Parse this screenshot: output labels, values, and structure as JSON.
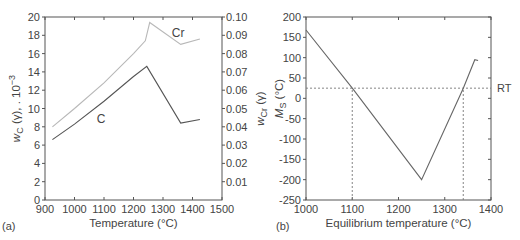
{
  "figure": {
    "width": 520,
    "height": 240,
    "colors": {
      "axis": "#555555",
      "text": "#444444",
      "c_curve": "#555555",
      "cr_curve": "#b8b8b8",
      "ms_curve": "#666666",
      "dashed": "#777777"
    }
  },
  "chart_data": [
    {
      "type": "line",
      "panel_label": "(a)",
      "title": "",
      "xlabel": "Temperature (°C)",
      "ylabel": "w_C (γ), . 10^-3",
      "ylabel_right": "w_Cr (γ)",
      "xlim": [
        900,
        1500
      ],
      "ylim": [
        0,
        20
      ],
      "ylim_right": [
        0,
        0.1
      ],
      "grid": false,
      "legend": "inline curve labels",
      "x_ticks": [
        900,
        1000,
        1100,
        1200,
        1300,
        1400,
        1500
      ],
      "y_ticks": [
        0,
        2,
        4,
        6,
        8,
        10,
        12,
        14,
        16,
        18,
        20
      ],
      "y_ticks_right": [
        "0.01",
        "0.02",
        "0.03",
        "0.04",
        "0.05",
        "0.06",
        "0.07",
        "0.08",
        "0.09",
        "0.10"
      ],
      "series": [
        {
          "name": "C",
          "axis": "left",
          "label_pos": [
            1075,
            8.9
          ],
          "x": [
            925,
            1000,
            1100,
            1200,
            1245,
            1360,
            1425
          ],
          "y": [
            6.6,
            8.3,
            10.8,
            13.5,
            14.6,
            8.4,
            8.8
          ]
        },
        {
          "name": "Cr",
          "axis": "right",
          "label_pos": [
            1330,
            0.091
          ],
          "x": [
            925,
            1000,
            1100,
            1200,
            1240,
            1255,
            1360,
            1425
          ],
          "y": [
            0.04,
            0.05,
            0.064,
            0.08,
            0.087,
            0.097,
            0.085,
            0.088
          ]
        }
      ]
    },
    {
      "type": "line",
      "panel_label": "(b)",
      "title": "",
      "xlabel": "Equilibrium temperature (°C)",
      "ylabel": "M_S (°C)",
      "xlim": [
        1000,
        1400
      ],
      "ylim": [
        -250,
        200
      ],
      "grid": false,
      "x_ticks": [
        1000,
        1100,
        1200,
        1300,
        1400
      ],
      "y_ticks": [
        -250,
        -200,
        -150,
        -100,
        -50,
        0,
        50,
        100,
        150,
        200
      ],
      "series": [
        {
          "name": "M_S",
          "x": [
            1000,
            1100,
            1250,
            1340,
            1365,
            1372
          ],
          "y": [
            168,
            25,
            -200,
            25,
            95,
            93
          ]
        }
      ],
      "annotations": [
        {
          "type": "hline_dashed",
          "y": 25,
          "x_from": 1000,
          "x_to": 1400,
          "label": "RT"
        },
        {
          "type": "vline_dashed",
          "x": 1100,
          "y_from": -250,
          "y_to": 25
        },
        {
          "type": "vline_dashed",
          "x": 1340,
          "y_from": -250,
          "y_to": 25
        }
      ]
    }
  ]
}
